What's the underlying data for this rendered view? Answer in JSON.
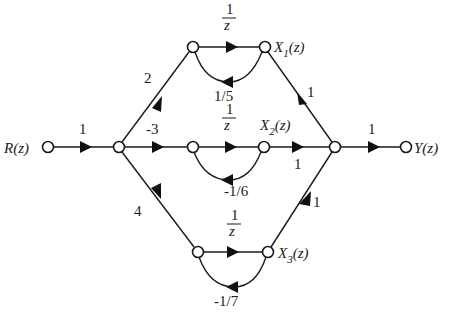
{
  "diagram": {
    "type": "signal-flow-graph",
    "nodes": {
      "input": "R(z)",
      "output": "Y(z)",
      "x1": {
        "name": "X",
        "sub": "1",
        "arg": "(z)"
      },
      "x2": {
        "name": "X",
        "sub": "2",
        "arg": "(z)"
      },
      "x3": {
        "name": "X",
        "sub": "3",
        "arg": "(z)"
      }
    },
    "gains": {
      "input_branch": "1",
      "to_top": "2",
      "to_middle": "-3",
      "to_bottom": "4",
      "delay_num": "1",
      "delay_den": "z",
      "top_feedback": "1/5",
      "middle_feedback": "-1/6",
      "bottom_feedback": "-1/7",
      "x1_to_sum": "1",
      "x2_to_sum": "1",
      "x3_to_sum": "1",
      "output_branch": "1"
    }
  }
}
